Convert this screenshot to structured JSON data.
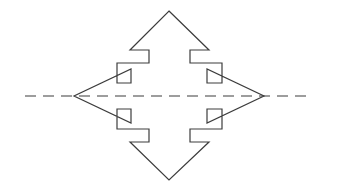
{
  "figure": {
    "background_color": "#ffffff",
    "width": 338,
    "height": 193,
    "shapes": {
      "four_way_arrow": {
        "name": "four-way-arrow",
        "description": "Four-pointed stepped arrow outline pointing up, down, left and right",
        "stroke_color": "#3c3c3c",
        "stroke_width": 1.2,
        "fill": "none",
        "center": {
          "x": 169,
          "y": 96
        },
        "tips": {
          "up": {
            "x": 169,
            "y": 11
          },
          "down": {
            "x": 169,
            "y": 180
          },
          "left": {
            "x": 74,
            "y": 96
          },
          "right": {
            "x": 264,
            "y": 96
          }
        },
        "points": "169,11 209,50 190,50 190,63 222,63 222,83 207,83 207,69 264,96 207,123 207,109 222,109 222,129 190,129 190,142 209,142 169,180 130,142 149,142 149,129 117,129 117,109 131,109 131,123 74,96 131,69 131,83 117,83 117,63 149,63 149,50 130,50"
      },
      "axis_line": {
        "name": "horizontal-dashed-axis-line",
        "description": "Horizontal centre dash-dot construction line crossing the figure",
        "stroke_color": "#3c3c3c",
        "stroke_width": 1.2,
        "dash_pattern": "11 7",
        "y": 96,
        "x_start": 25,
        "x_end": 312
      }
    }
  },
  "chart_data": {
    "type": "diagram",
    "xlabel": "",
    "ylabel": "",
    "elements": [
      {
        "name": "four-way-arrow",
        "kind": "polygon-outline",
        "vertex_count": 32,
        "symmetry": "4-fold (90 degree rotational)",
        "span_horizontal_px": 190,
        "span_vertical_px": 169
      },
      {
        "name": "horizontal-dashed-axis-line",
        "kind": "dashed-line",
        "length_px": 287,
        "orientation": "horizontal"
      }
    ]
  }
}
